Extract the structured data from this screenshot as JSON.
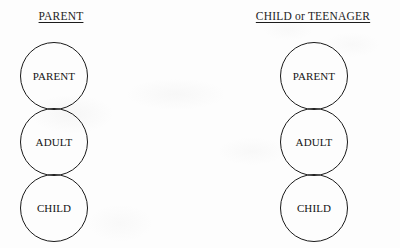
{
  "diagram": {
    "title_left": "PARENT",
    "title_right": "CHILD or TEENAGER",
    "background_color": "#fdfdfd",
    "stroke_color": "#1a1a1a",
    "text_color": "#141414",
    "columns": [
      {
        "header": "PARENT",
        "header_center_x": 61,
        "header_y": 10,
        "stack_center_x": 54,
        "nodes": [
          {
            "label": "PARENT",
            "top": 42
          },
          {
            "label": "ADULT",
            "top": 108
          },
          {
            "label": "CHILD",
            "top": 174
          }
        ]
      },
      {
        "header": "CHILD or TEENAGER",
        "header_center_x": 313,
        "header_y": 10,
        "stack_center_x": 314,
        "nodes": [
          {
            "label": "PARENT",
            "top": 42
          },
          {
            "label": "ADULT",
            "top": 108
          },
          {
            "label": "CHILD",
            "top": 174
          }
        ]
      }
    ]
  }
}
